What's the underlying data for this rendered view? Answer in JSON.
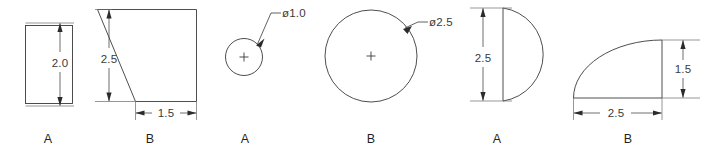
{
  "sheet": {
    "background_color": "#ffffff",
    "line_color": "#3a3a3a",
    "text_color": "#2b2b2b",
    "width": 718,
    "height": 160
  },
  "figures": [
    {
      "id": "rectangle",
      "label": "A",
      "shape_name": "rectangle",
      "dimensions": [
        {
          "name": "height",
          "text": "2.0",
          "value": 2.0
        }
      ]
    },
    {
      "id": "trapezoid",
      "label": "B",
      "shape_name": "right-trapezoid",
      "dimensions": [
        {
          "name": "height",
          "text": "2.5",
          "value": 2.5
        },
        {
          "name": "bottom-width",
          "text": "1.5",
          "value": 1.5
        }
      ]
    },
    {
      "id": "small-circle",
      "label": "A",
      "shape_name": "circle",
      "dimensions": [
        {
          "name": "diameter",
          "text": "ø1.0",
          "value": 1.0
        }
      ]
    },
    {
      "id": "large-circle",
      "label": "B",
      "shape_name": "circle",
      "dimensions": [
        {
          "name": "diameter",
          "text": "ø2.5",
          "value": 2.5
        }
      ]
    },
    {
      "id": "d-shape",
      "label": "A",
      "shape_name": "half-circle-flat-left",
      "dimensions": [
        {
          "name": "height",
          "text": "2.5",
          "value": 2.5
        }
      ]
    },
    {
      "id": "quarter-round",
      "label": "B",
      "shape_name": "quarter-elliptical-fillet",
      "dimensions": [
        {
          "name": "width",
          "text": "2.5",
          "value": 2.5
        },
        {
          "name": "height",
          "text": "1.5",
          "value": 1.5
        }
      ]
    }
  ],
  "labels": {
    "rectangle": "A",
    "trapezoid": "B",
    "small_circle": "A",
    "large_circle": "B",
    "d_shape": "A",
    "quarter_round": "B"
  },
  "dimension_texts": {
    "rect_height": "2.0",
    "trap_height": "2.5",
    "trap_width": "1.5",
    "small_circle_dia": "ø1.0",
    "large_circle_dia": "ø2.5",
    "d_shape_height": "2.5",
    "quarter_width": "2.5",
    "quarter_height": "1.5"
  }
}
